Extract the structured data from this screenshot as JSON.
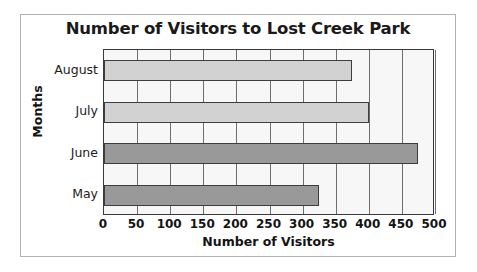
{
  "chart_data": {
    "type": "bar",
    "orientation": "horizontal",
    "title": "Number of Visitors to Lost Creek Park",
    "xlabel": "Number of Visitors",
    "ylabel": "Months",
    "categories": [
      "May",
      "June",
      "July",
      "August"
    ],
    "values": [
      325,
      475,
      400,
      375
    ],
    "bar_colors": [
      "#999999",
      "#999999",
      "#d2d2d2",
      "#d2d2d2"
    ],
    "xlim": [
      0,
      500
    ],
    "xticks": [
      0,
      50,
      100,
      150,
      200,
      250,
      300,
      350,
      400,
      450,
      500
    ],
    "xtick_labels": [
      "0",
      "50",
      "100",
      "150",
      "200",
      "250",
      "300",
      "350",
      "400",
      "450",
      "500"
    ],
    "ytick_labels_top_to_bottom": [
      "August",
      "July",
      "June",
      "May"
    ],
    "grid": "vertical",
    "legend": "none",
    "plot_background": "#f7f7f7",
    "bar_edge_color": "#3d3d3d",
    "axis_color": "#3a3a3a",
    "frame_color": "#b3b3b3"
  }
}
